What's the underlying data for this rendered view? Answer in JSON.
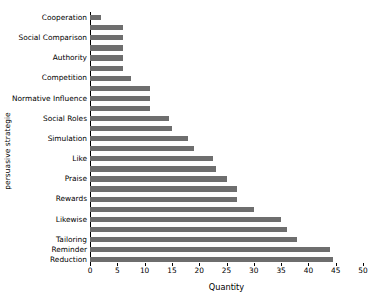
{
  "chart_data": {
    "type": "bar",
    "orientation": "horizontal",
    "title": "",
    "xlabel": "Quantity",
    "ylabel": "persuasive strategie",
    "xlim": [
      0,
      50
    ],
    "xticks": [
      0,
      5,
      10,
      15,
      20,
      25,
      30,
      35,
      40,
      45,
      50
    ],
    "grid": false,
    "legend": null,
    "bar_color": "#6e6e6e",
    "categories": [
      "Cooperation",
      "",
      "Social Comparison",
      "",
      "Authority",
      "",
      "Competition",
      "",
      "Normative Influence",
      "",
      "Social Roles",
      "",
      "Simulation",
      "",
      "Like",
      "",
      "Praise",
      "",
      "Rewards",
      "",
      "Likewise",
      "",
      "Tailoring",
      "Reminder",
      "Reduction"
    ],
    "values": [
      2,
      6,
      6,
      6,
      6,
      6,
      7.5,
      11,
      11,
      11,
      14.5,
      15,
      18,
      19,
      22.5,
      23,
      25,
      27,
      27,
      30,
      35,
      36,
      38,
      44,
      44.5
    ],
    "labeled_categories": [
      "Cooperation",
      "Social Comparison",
      "Authority",
      "Competition",
      "Normative Influence",
      "Social Roles",
      "Simulation",
      "Like",
      "Praise",
      "Rewards",
      "Likewise",
      "Tailoring",
      "Reminder",
      "Reduction"
    ]
  }
}
